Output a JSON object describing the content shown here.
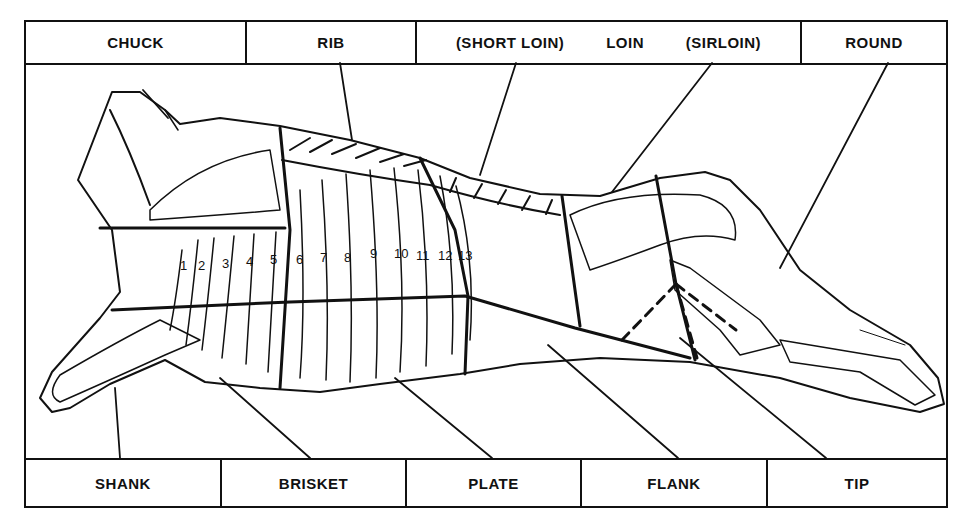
{
  "top_labels": {
    "chuck": "CHUCK",
    "rib": "RIB",
    "short_loin": "(SHORT LOIN)",
    "loin": "LOIN",
    "sirloin": "(SIRLOIN)",
    "round": "ROUND"
  },
  "bottom_labels": {
    "shank": "SHANK",
    "brisket": "BRISKET",
    "plate": "PLATE",
    "flank": "FLANK",
    "tip": "TIP"
  },
  "rib_numbers": [
    "1",
    "2",
    "3",
    "4",
    "5",
    "6",
    "7",
    "8",
    "9",
    "10",
    "11",
    "12",
    "13"
  ],
  "colors": {
    "ink": "#111111",
    "paper": "#ffffff"
  }
}
